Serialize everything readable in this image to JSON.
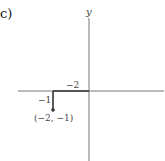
{
  "part_label": "c)",
  "axes": {
    "y_label": "y"
  },
  "point": {
    "x": -2,
    "y": -1,
    "label": "(−2, −1)"
  },
  "segments": {
    "horizontal_label": "−2",
    "vertical_label": "−1"
  },
  "colors": {
    "axis": "#777777",
    "path": "#333333",
    "text": "#444444"
  }
}
